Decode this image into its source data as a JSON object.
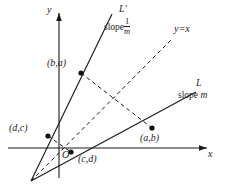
{
  "figure": {
    "type": "geometry-diagram",
    "axes": {
      "x_label": "x",
      "y_label": "y",
      "origin_label": "O"
    },
    "lines": [
      {
        "id": "L",
        "label": "L",
        "slope_text_prefix": "slope",
        "slope_text_value": "m",
        "style": "solid"
      },
      {
        "id": "L-prime",
        "label": "L'",
        "slope_text_prefix": "slope",
        "slope_numerator": "1",
        "slope_denominator": "m",
        "style": "solid"
      },
      {
        "id": "y-equals-x",
        "label": "y=x",
        "style": "dashed"
      }
    ],
    "points": [
      {
        "id": "b-a",
        "label": "(b,a)",
        "on_line": "L-prime"
      },
      {
        "id": "d-c",
        "label": "(d,c)",
        "on_line": "L-prime"
      },
      {
        "id": "a-b",
        "label": "(a,b)",
        "on_line": "L"
      },
      {
        "id": "c-d",
        "label": "(c,d)",
        "on_line": "L"
      }
    ],
    "colors": {
      "stroke": "#1a1a1a",
      "background": "#ffffff"
    }
  }
}
